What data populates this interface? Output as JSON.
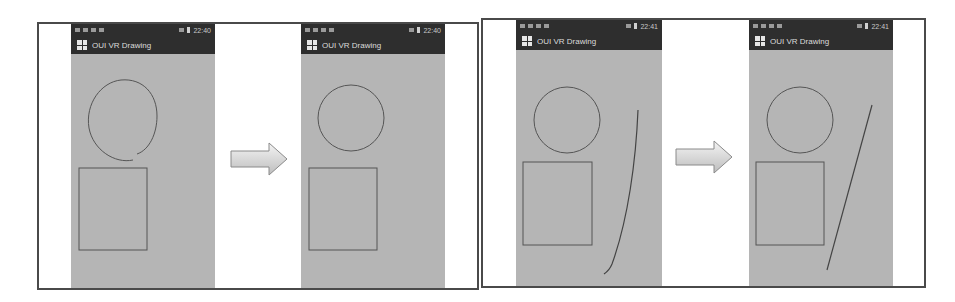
{
  "figure": {
    "panels": [
      {
        "name": "circle-correction",
        "before": {
          "status_time": "22:40",
          "app_title": "OUI VR Drawing",
          "shapes": [
            "rough-circle",
            "rectangle"
          ]
        },
        "after": {
          "status_time": "22:40",
          "app_title": "OUI VR Drawing",
          "shapes": [
            "circle",
            "rectangle"
          ]
        }
      },
      {
        "name": "line-correction",
        "before": {
          "status_time": "22:41",
          "app_title": "OUI VR Drawing",
          "shapes": [
            "circle",
            "rectangle",
            "curved-stroke"
          ]
        },
        "after": {
          "status_time": "22:41",
          "app_title": "OUI VR Drawing",
          "shapes": [
            "circle",
            "rectangle",
            "straight-line"
          ]
        }
      }
    ],
    "arrow_icon": "right-arrow-icon",
    "colors": {
      "canvas": "#b5b5b5",
      "bar": "#2e2e2e",
      "stroke": "#555555",
      "frame": "#4a4a4a"
    }
  }
}
